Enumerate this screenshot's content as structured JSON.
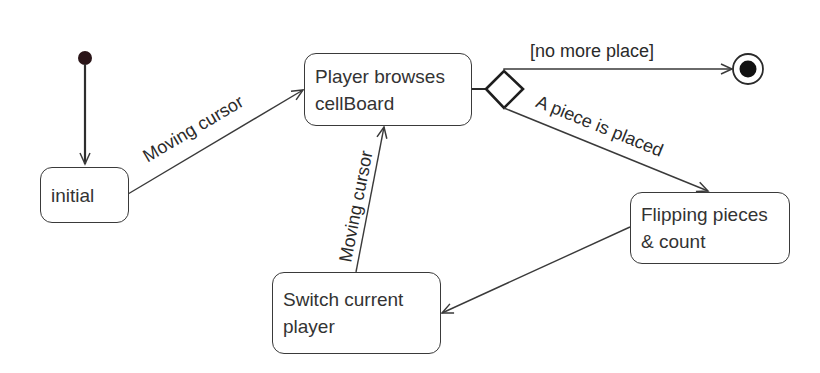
{
  "diagram": {
    "type": "uml-state-machine",
    "colors": {
      "line": "#3a3a3a",
      "text": "#333333",
      "start_dot": "#2a1518",
      "background": "#ffffff"
    },
    "states": [
      {
        "id": "initial",
        "lines": [
          "initial"
        ]
      },
      {
        "id": "browse",
        "lines": [
          "Player browses",
          "cellBoard"
        ]
      },
      {
        "id": "flip",
        "lines": [
          "Flipping pieces",
          "& count"
        ]
      },
      {
        "id": "switch",
        "lines": [
          "Switch current",
          "player"
        ]
      }
    ],
    "pseudostates": {
      "start": "initial-pseudostate",
      "decision": "choice-diamond",
      "end": "final-state"
    },
    "transitions": [
      {
        "from": "start",
        "to": "initial",
        "label": ""
      },
      {
        "from": "initial",
        "to": "browse",
        "label": "Moving cursor"
      },
      {
        "from": "browse",
        "to": "decision",
        "label": ""
      },
      {
        "from": "decision",
        "to": "end",
        "label": "[no more place]"
      },
      {
        "from": "decision",
        "to": "flip",
        "label": "A piece is placed"
      },
      {
        "from": "flip",
        "to": "switch",
        "label": ""
      },
      {
        "from": "switch",
        "to": "browse",
        "label": "Moving cursor"
      }
    ]
  }
}
